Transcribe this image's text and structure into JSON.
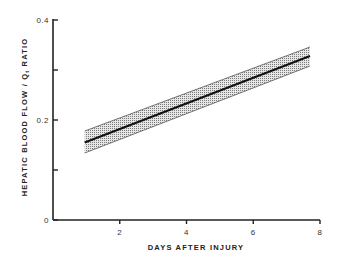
{
  "chart_data": {
    "type": "line",
    "title": "",
    "xlabel": "DAYS AFTER INJURY",
    "ylabel": "HEPATIC BLOOD FLOW / Q_t RATIO",
    "ylabel_parts": {
      "main": "HEPATIC BLOOD FLOW / Q",
      "subscript": "t",
      "suffix": "RATIO"
    },
    "xlim": [
      0,
      8
    ],
    "ylim": [
      0,
      0.4
    ],
    "x_ticks": [
      2,
      4,
      6,
      8
    ],
    "x_tick_labels": [
      "2",
      "4",
      "6",
      "8"
    ],
    "y_ticks": [
      0,
      0.1,
      0.2,
      0.3,
      0.4
    ],
    "y_tick_labels": [
      "0",
      "",
      "0.2",
      "",
      "0.4"
    ],
    "grid": false,
    "legend": null,
    "series": [
      {
        "name": "regression line",
        "x": [
          0.95,
          7.7
        ],
        "values": [
          0.155,
          0.328
        ],
        "color": "#111111"
      },
      {
        "name": "confidence band upper",
        "x": [
          0.95,
          7.7
        ],
        "values": [
          0.178,
          0.346
        ],
        "color": "#555555"
      },
      {
        "name": "confidence band lower",
        "x": [
          0.95,
          7.7
        ],
        "values": [
          0.134,
          0.308
        ],
        "color": "#555555"
      }
    ],
    "band_fill": "stippled gray"
  }
}
